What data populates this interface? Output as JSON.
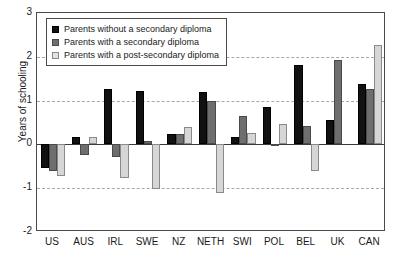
{
  "chart_data": {
    "type": "bar",
    "title": "",
    "xlabel": "",
    "ylabel": "Years of schooling",
    "ylim": [
      -2,
      3
    ],
    "yticks": [
      "3",
      "2",
      "1",
      "0",
      "-1",
      "-2"
    ],
    "ytick_values": [
      3,
      2,
      1,
      0,
      -1,
      -2
    ],
    "grid": true,
    "gridlines_at": [
      2,
      1,
      -1
    ],
    "zero_line": 0,
    "legend_position": "top-left",
    "categories": [
      "US",
      "AUS",
      "IRL",
      "SWE",
      "NZ",
      "NETH",
      "SWI",
      "POL",
      "BEL",
      "UK",
      "CAN"
    ],
    "series": [
      {
        "name": "Parents without a secondary diploma",
        "color": "#111111",
        "values": [
          -0.55,
          0.17,
          1.27,
          1.22,
          0.23,
          1.2,
          0.18,
          0.86,
          1.82,
          0.55,
          1.37
        ]
      },
      {
        "name": "Parents with a secondary diploma",
        "color": "#6e6e6e",
        "values": [
          -0.6,
          -0.25,
          -0.28,
          0.08,
          0.23,
          0.99,
          0.64,
          0.02,
          0.42,
          1.92,
          1.26
        ]
      },
      {
        "name": "Parents with a post-secondary diploma",
        "color": "#d6d6d6",
        "values": [
          -0.72,
          0.17,
          -0.77,
          -1.02,
          0.4,
          -1.12,
          0.25,
          0.47,
          -0.6,
          0.0,
          2.27
        ]
      }
    ]
  }
}
